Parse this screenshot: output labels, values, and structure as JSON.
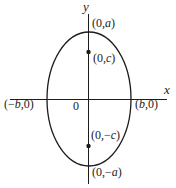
{
  "figure": {
    "background": "#ffffff",
    "line_color": "#1c1c1c",
    "axes": {
      "x_label": "x",
      "y_label": "y",
      "origin_label": "0"
    },
    "labels": {
      "top_vertex": {
        "pre": "(0,",
        "var": "a",
        "post": ")"
      },
      "top_focus": {
        "pre": "(0,",
        "var": "c",
        "post": ")"
      },
      "left_vertex": {
        "pre": "(−",
        "var": "b",
        "post": ",0)"
      },
      "right_vertex": {
        "pre": "(",
        "var": "b",
        "post": ",0)"
      },
      "bottom_focus": {
        "pre": "(0,−",
        "var": "c",
        "post": ")"
      },
      "bottom_vertex": {
        "pre": "(0,−",
        "var": "a",
        "post": ")"
      }
    }
  }
}
